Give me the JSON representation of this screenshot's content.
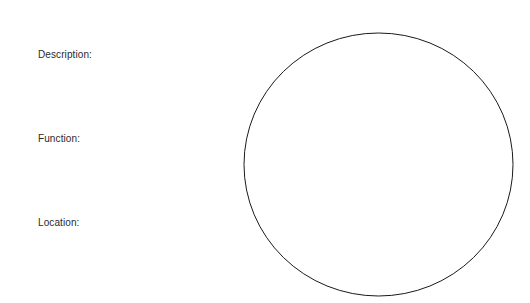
{
  "worksheet": {
    "fields": [
      {
        "label": "Description:"
      },
      {
        "label": "Function:"
      },
      {
        "label": "Location:"
      }
    ],
    "drawing_area": {
      "shape": "circle-icon",
      "stroke_color": "#1a1a1a",
      "fill_color": "#ffffff"
    }
  }
}
